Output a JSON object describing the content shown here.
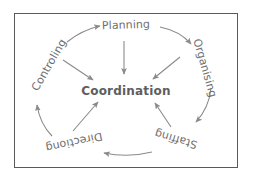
{
  "diagram": {
    "title": "Coordination",
    "center": {
      "label": "Coordination"
    },
    "nodes": [
      {
        "id": "planning",
        "label": "Planning",
        "position": "top"
      },
      {
        "id": "organising",
        "label": "Organising",
        "position": "upper-right"
      },
      {
        "id": "staffing",
        "label": "Staffing",
        "position": "lower-right"
      },
      {
        "id": "directiong",
        "label": "Directiong",
        "position": "lower-left"
      },
      {
        "id": "controling",
        "label": "Controling",
        "position": "upper-left"
      }
    ],
    "cycle_arrows": [
      {
        "from": "planning",
        "to": "organising"
      },
      {
        "from": "organising",
        "to": "staffing"
      },
      {
        "from": "staffing",
        "to": "directiong"
      },
      {
        "from": "directiong",
        "to": "controling"
      },
      {
        "from": "controling",
        "to": "planning"
      }
    ],
    "spoke_arrows": [
      {
        "from": "planning",
        "to": "center"
      },
      {
        "from": "organising",
        "to": "center"
      },
      {
        "from": "staffing",
        "to": "center"
      },
      {
        "from": "directiong",
        "to": "center"
      },
      {
        "from": "controling",
        "to": "center"
      }
    ],
    "colors": {
      "stroke": "#8a8a8a",
      "text": "#6e6e6e",
      "center_text": "#5e5e5e",
      "border": "#5a5a5a",
      "background": "#ffffff"
    }
  }
}
